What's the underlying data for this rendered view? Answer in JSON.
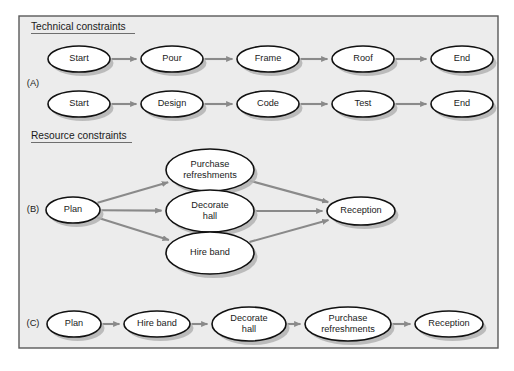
{
  "figure": {
    "panel": {
      "x": 19,
      "y": 16,
      "width": 479,
      "height": 332,
      "fill": "#ececec",
      "border": "#5a5a5a"
    },
    "colors": {
      "node_fill": "#ffffff",
      "node_stroke": "#111111",
      "edge": "#8a8a8a",
      "shadow": "#b3b3b3",
      "text": "#1a1a1a",
      "page_background": "#ffffff"
    },
    "headings": [
      {
        "id": "technical",
        "text": "Technical constraints",
        "x": 31,
        "y": 30,
        "underline_width": 104
      },
      {
        "id": "resource",
        "text": "Resource constraints",
        "x": 31,
        "y": 139,
        "underline_width": 101
      }
    ],
    "group_labels": [
      {
        "id": "A",
        "text": "(A)",
        "x": 33,
        "y": 84
      },
      {
        "id": "B",
        "text": "(B)",
        "x": 33,
        "y": 210
      },
      {
        "id": "C",
        "text": "(C)",
        "x": 33,
        "y": 324
      }
    ],
    "nodes": [
      {
        "id": "a1-start",
        "label": "Start",
        "cx": 79,
        "cy": 59,
        "rx": 31,
        "ry": 13,
        "lines": [
          "Start"
        ]
      },
      {
        "id": "a1-pour",
        "label": "Pour",
        "cx": 172,
        "cy": 59,
        "rx": 31,
        "ry": 13,
        "lines": [
          "Pour"
        ]
      },
      {
        "id": "a1-frame",
        "label": "Frame",
        "cx": 268,
        "cy": 59,
        "rx": 31,
        "ry": 13,
        "lines": [
          "Frame"
        ]
      },
      {
        "id": "a1-roof",
        "label": "Roof",
        "cx": 363,
        "cy": 59,
        "rx": 31,
        "ry": 13,
        "lines": [
          "Roof"
        ]
      },
      {
        "id": "a1-end",
        "label": "End",
        "cx": 462,
        "cy": 59,
        "rx": 31,
        "ry": 13,
        "lines": [
          "End"
        ]
      },
      {
        "id": "a2-start",
        "label": "Start",
        "cx": 79,
        "cy": 104,
        "rx": 31,
        "ry": 13,
        "lines": [
          "Start"
        ]
      },
      {
        "id": "a2-design",
        "label": "Design",
        "cx": 172,
        "cy": 104,
        "rx": 31,
        "ry": 13,
        "lines": [
          "Design"
        ]
      },
      {
        "id": "a2-code",
        "label": "Code",
        "cx": 268,
        "cy": 104,
        "rx": 31,
        "ry": 13,
        "lines": [
          "Code"
        ]
      },
      {
        "id": "a2-test",
        "label": "Test",
        "cx": 363,
        "cy": 104,
        "rx": 31,
        "ry": 13,
        "lines": [
          "Test"
        ]
      },
      {
        "id": "a2-end",
        "label": "End",
        "cx": 462,
        "cy": 104,
        "rx": 31,
        "ry": 13,
        "lines": [
          "End"
        ]
      },
      {
        "id": "b-plan",
        "label": "Plan",
        "cx": 73,
        "cy": 210,
        "rx": 27,
        "ry": 13,
        "lines": [
          "Plan"
        ]
      },
      {
        "id": "b-purchase",
        "label": "Purchase refreshments",
        "cx": 210,
        "cy": 170,
        "rx": 44,
        "ry": 21,
        "lines": [
          "Purchase",
          "refreshments"
        ]
      },
      {
        "id": "b-decorate",
        "label": "Decorate hall",
        "cx": 210,
        "cy": 211,
        "rx": 44,
        "ry": 21,
        "lines": [
          "Decorate",
          "hall"
        ]
      },
      {
        "id": "b-hire",
        "label": "Hire band",
        "cx": 210,
        "cy": 253,
        "rx": 44,
        "ry": 21,
        "lines": [
          "Hire band"
        ]
      },
      {
        "id": "b-reception",
        "label": "Reception",
        "cx": 361,
        "cy": 211,
        "rx": 34,
        "ry": 14,
        "lines": [
          "Reception"
        ]
      },
      {
        "id": "c-plan",
        "label": "Plan",
        "cx": 74,
        "cy": 324,
        "rx": 27,
        "ry": 13,
        "lines": [
          "Plan"
        ]
      },
      {
        "id": "c-hire",
        "label": "Hire band",
        "cx": 157,
        "cy": 324,
        "rx": 33,
        "ry": 13,
        "lines": [
          "Hire band"
        ]
      },
      {
        "id": "c-decorate",
        "label": "Decorate hall",
        "cx": 249,
        "cy": 324,
        "rx": 37,
        "ry": 17,
        "lines": [
          "Decorate",
          "hall"
        ]
      },
      {
        "id": "c-purchase",
        "label": "Purchase refreshments",
        "cx": 348,
        "cy": 324,
        "rx": 43,
        "ry": 17,
        "lines": [
          "Purchase",
          "refreshments"
        ]
      },
      {
        "id": "c-reception",
        "label": "Reception",
        "cx": 449,
        "cy": 324,
        "rx": 34,
        "ry": 13,
        "lines": [
          "Reception"
        ]
      }
    ],
    "edges": [
      {
        "id": "e-a1-1",
        "from": "a1-start",
        "to": "a1-pour"
      },
      {
        "id": "e-a1-2",
        "from": "a1-pour",
        "to": "a1-frame"
      },
      {
        "id": "e-a1-3",
        "from": "a1-frame",
        "to": "a1-roof"
      },
      {
        "id": "e-a1-4",
        "from": "a1-roof",
        "to": "a1-end"
      },
      {
        "id": "e-a2-1",
        "from": "a2-start",
        "to": "a2-design"
      },
      {
        "id": "e-a2-2",
        "from": "a2-design",
        "to": "a2-code"
      },
      {
        "id": "e-a2-3",
        "from": "a2-code",
        "to": "a2-test"
      },
      {
        "id": "e-a2-4",
        "from": "a2-test",
        "to": "a2-end"
      },
      {
        "id": "e-b-1",
        "from": "b-plan",
        "to": "b-purchase"
      },
      {
        "id": "e-b-2",
        "from": "b-plan",
        "to": "b-decorate"
      },
      {
        "id": "e-b-3",
        "from": "b-plan",
        "to": "b-hire"
      },
      {
        "id": "e-b-4",
        "from": "b-purchase",
        "to": "b-reception"
      },
      {
        "id": "e-b-5",
        "from": "b-decorate",
        "to": "b-reception"
      },
      {
        "id": "e-b-6",
        "from": "b-hire",
        "to": "b-reception"
      },
      {
        "id": "e-c-1",
        "from": "c-plan",
        "to": "c-hire"
      },
      {
        "id": "e-c-2",
        "from": "c-hire",
        "to": "c-decorate"
      },
      {
        "id": "e-c-3",
        "from": "c-decorate",
        "to": "c-purchase"
      },
      {
        "id": "e-c-4",
        "from": "c-purchase",
        "to": "c-reception"
      }
    ]
  }
}
